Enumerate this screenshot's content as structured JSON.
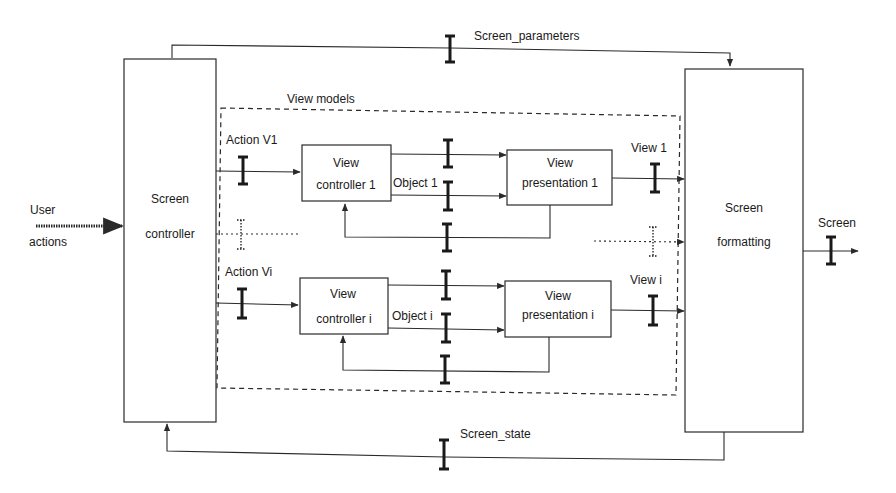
{
  "diagram": {
    "top_bus_label": "Screen_parameters",
    "bottom_bus_label": "Screen_state",
    "group_label": "View models",
    "input": {
      "label_line1": "User",
      "label_line2": "actions"
    },
    "output": {
      "label": "Screen"
    },
    "screen_controller": {
      "line1": "Screen",
      "line2": "controller"
    },
    "screen_formatting": {
      "line1": "Screen",
      "line2": "formatting"
    },
    "row1": {
      "action_label": "Action V1",
      "controller": {
        "line1": "View",
        "line2": "controller 1"
      },
      "object_label": "Object 1",
      "presentation": {
        "line1": "View",
        "line2": "presentation 1"
      },
      "view_label": "View 1"
    },
    "rowi": {
      "action_label": "Action Vi",
      "controller": {
        "line1": "View",
        "line2": "controller i"
      },
      "object_label": "Object i",
      "presentation": {
        "line1": "View",
        "line2": "presentation i"
      },
      "view_label": "View i"
    },
    "colors": {
      "stroke": "#2a2a2a",
      "background": "#ffffff"
    },
    "icons": [
      "ibeam-connector-icon",
      "dotted-ibeam-connector-icon",
      "arrow-icon"
    ]
  }
}
